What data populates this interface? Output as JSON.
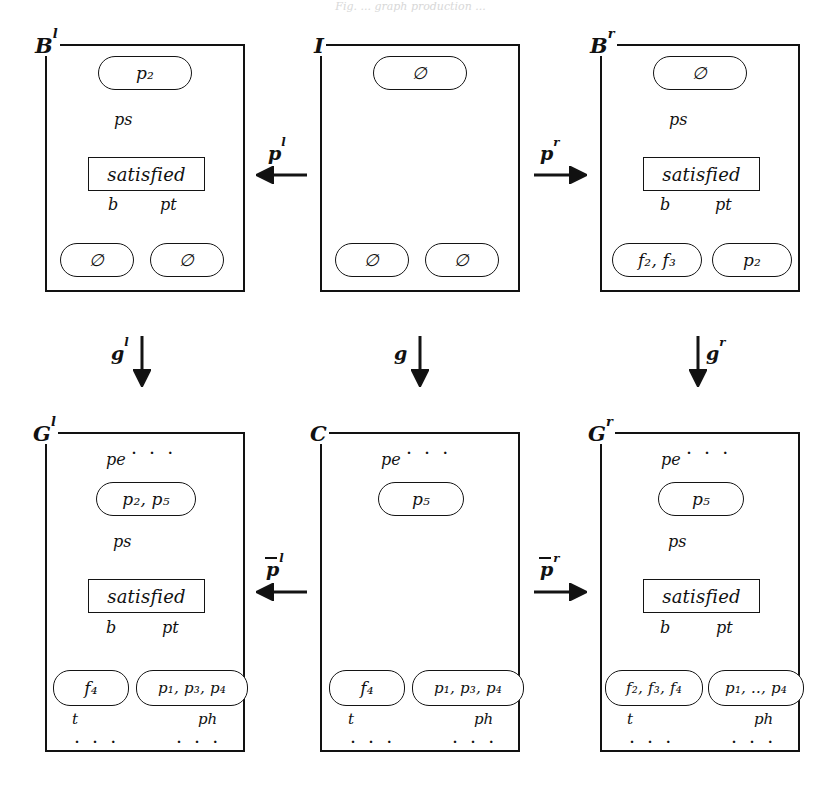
{
  "figure": {
    "type": "diagram",
    "kind": "double-pushout graph transformation (DPO) diagram",
    "caption_cropped": "Fig. ... graph production ...",
    "panels": [
      {
        "id": "Bl",
        "label": "B",
        "label_sup": "l",
        "nodes": [
          {
            "id": "Bl-top",
            "text": "p₂",
            "shape": "rounded"
          },
          {
            "id": "Bl-mid",
            "text": "satisfied",
            "shape": "box"
          },
          {
            "id": "Bl-bl",
            "text": "∅",
            "shape": "rounded"
          },
          {
            "id": "Bl-br",
            "text": "∅",
            "shape": "rounded"
          }
        ],
        "edges": [
          {
            "from": "Bl-top",
            "to": "Bl-mid",
            "label": "ps"
          },
          {
            "from": "Bl-mid",
            "to": "Bl-bl",
            "label": "b"
          },
          {
            "from": "Bl-mid",
            "to": "Bl-br",
            "label": "pt"
          }
        ]
      },
      {
        "id": "I",
        "label": "I",
        "label_sup": "",
        "nodes": [
          {
            "id": "I-top",
            "text": "∅",
            "shape": "rounded"
          },
          {
            "id": "I-bl",
            "text": "∅",
            "shape": "rounded"
          },
          {
            "id": "I-br",
            "text": "∅",
            "shape": "rounded"
          }
        ],
        "edges": []
      },
      {
        "id": "Br",
        "label": "B",
        "label_sup": "r",
        "nodes": [
          {
            "id": "Br-top",
            "text": "∅",
            "shape": "rounded"
          },
          {
            "id": "Br-mid",
            "text": "satisfied",
            "shape": "box"
          },
          {
            "id": "Br-bl",
            "text": "f₂, f₃",
            "shape": "rounded"
          },
          {
            "id": "Br-br",
            "text": "p₂",
            "shape": "rounded"
          }
        ],
        "edges": [
          {
            "from": "Br-top",
            "to": "Br-mid",
            "label": "ps"
          },
          {
            "from": "Br-mid",
            "to": "Br-bl",
            "label": "b"
          },
          {
            "from": "Br-mid",
            "to": "Br-br",
            "label": "pt"
          }
        ]
      },
      {
        "id": "Gl",
        "label": "G",
        "label_sup": "l",
        "nodes": [
          {
            "id": "Gl-top",
            "text": "p₂, p₅",
            "shape": "rounded"
          },
          {
            "id": "Gl-mid",
            "text": "satisfied",
            "shape": "box"
          },
          {
            "id": "Gl-bl",
            "text": "f₄",
            "shape": "rounded"
          },
          {
            "id": "Gl-br",
            "text": "p₁, p₃, p₄",
            "shape": "rounded"
          }
        ],
        "edges": [
          {
            "from": "dots-in",
            "to": "Gl-top",
            "label": "pe"
          },
          {
            "from": "Gl-top",
            "to": "Gl-mid",
            "label": "ps"
          },
          {
            "from": "Gl-mid",
            "to": "Gl-bl",
            "label": "b"
          },
          {
            "from": "Gl-mid",
            "to": "Gl-br",
            "label": "pt"
          },
          {
            "from": "Gl-bl",
            "to": "dots-out-left",
            "label": "t"
          },
          {
            "from": "Gl-br",
            "to": "dots-out-right",
            "label": "ph"
          }
        ]
      },
      {
        "id": "C",
        "label": "C",
        "label_sup": "",
        "nodes": [
          {
            "id": "C-top",
            "text": "p₅",
            "shape": "rounded"
          },
          {
            "id": "C-bl",
            "text": "f₄",
            "shape": "rounded"
          },
          {
            "id": "C-br",
            "text": "p₁, p₃, p₄",
            "shape": "rounded"
          }
        ],
        "edges": [
          {
            "from": "dots-in",
            "to": "C-top",
            "label": "pe"
          },
          {
            "from": "C-bl",
            "to": "dots-out-left",
            "label": "t"
          },
          {
            "from": "C-br",
            "to": "dots-out-right",
            "label": "ph"
          }
        ]
      },
      {
        "id": "Gr",
        "label": "G",
        "label_sup": "r",
        "nodes": [
          {
            "id": "Gr-top",
            "text": "p₅",
            "shape": "rounded"
          },
          {
            "id": "Gr-mid",
            "text": "satisfied",
            "shape": "box"
          },
          {
            "id": "Gr-bl",
            "text": "f₂, f₃, f₄",
            "shape": "rounded"
          },
          {
            "id": "Gr-br",
            "text": "p₁, .., p₄",
            "shape": "rounded"
          }
        ],
        "edges": [
          {
            "from": "dots-in",
            "to": "Gr-top",
            "label": "pe"
          },
          {
            "from": "Gr-top",
            "to": "Gr-mid",
            "label": "ps"
          },
          {
            "from": "Gr-mid",
            "to": "Gr-bl",
            "label": "b"
          },
          {
            "from": "Gr-mid",
            "to": "Gr-br",
            "label": "pt"
          },
          {
            "from": "Gr-bl",
            "to": "dots-out-left",
            "label": "t"
          },
          {
            "from": "Gr-br",
            "to": "dots-out-right",
            "label": "ph"
          }
        ]
      }
    ],
    "morphisms": [
      {
        "id": "pl",
        "base": "p",
        "sup": "l",
        "bar": false,
        "direction": "left",
        "from": "I",
        "to": "Bl"
      },
      {
        "id": "pr",
        "base": "p",
        "sup": "r",
        "bar": false,
        "direction": "right",
        "from": "I",
        "to": "Br"
      },
      {
        "id": "gl",
        "base": "g",
        "sup": "l",
        "bar": false,
        "direction": "down",
        "from": "Bl",
        "to": "Gl"
      },
      {
        "id": "g",
        "base": "g",
        "sup": "",
        "bar": false,
        "direction": "down",
        "from": "I",
        "to": "C"
      },
      {
        "id": "gr",
        "base": "g",
        "sup": "r",
        "bar": false,
        "direction": "down",
        "from": "Br",
        "to": "Gr"
      },
      {
        "id": "pbarl",
        "base": "p",
        "sup": "l",
        "bar": true,
        "direction": "left",
        "from": "C",
        "to": "Gl"
      },
      {
        "id": "pbarr",
        "base": "p",
        "sup": "r",
        "bar": true,
        "direction": "right",
        "from": "C",
        "to": "Gr"
      }
    ],
    "ellipsis": "· · ·",
    "colors": {
      "stroke": "#141414",
      "background": "#ffffff"
    }
  }
}
